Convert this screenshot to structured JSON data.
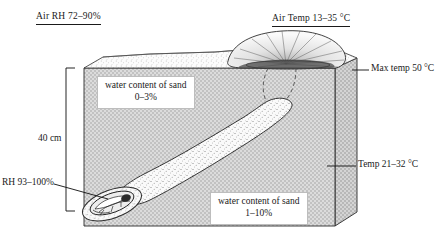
{
  "figure": {
    "type": "cross-section diagram",
    "labels": {
      "air_rh": "Air RH 72–90%",
      "air_temp": "Air Temp 13–35 °C",
      "max_temp": "Max temp 50 °C",
      "mid_temp": "Temp 21–32 °C",
      "burrow_rh": "RH 93–100%",
      "depth": "40 cm",
      "water_upper_line1": "water content of sand",
      "water_upper_line2": "0–3%",
      "water_lower_line1": "water content of sand",
      "water_lower_line2": "1–10%"
    },
    "colors": {
      "ink": "#1a1a1a",
      "block_front": "#cfcfcf",
      "block_side": "#c4c4c4",
      "block_top": "#f2f2f2",
      "burrow_fill": "#fbfbfb",
      "mound_fill": "#f6f6f6"
    }
  }
}
